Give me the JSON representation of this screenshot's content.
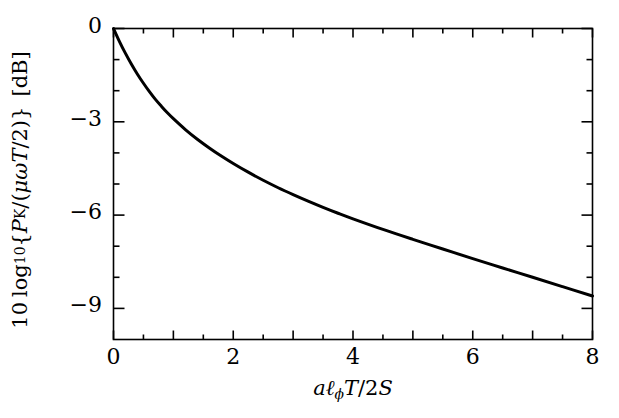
{
  "figure": {
    "background_color": "#ffffff",
    "line_color": "#000000",
    "axis_color": "#000000"
  },
  "axis_titles": {
    "y_parts": {
      "coefficient": "10",
      "log": "log",
      "log_base": "10",
      "open_brace": "{",
      "numerator_P": "P",
      "numerator_sub": "K",
      "slash": "/",
      "open_paren": "(",
      "mu": "μ",
      "omega": "ω",
      "T": "T",
      "over_two": "/2",
      "close_paren": ")",
      "close_brace": "}",
      "unit": "[dB]"
    },
    "y_plain": "10 log10{PK/(μωT/2)} [dB]",
    "x_parts": {
      "a": "a",
      "ell": "ℓ",
      "ell_sub": "ϕ",
      "T": "T",
      "slash_two": "/2",
      "S": "S"
    },
    "x_plain": "aℓϕT/2S"
  },
  "ticks": {
    "x_major_labels": [
      "0",
      "2",
      "4",
      "6",
      "8"
    ],
    "x_major_values": [
      0,
      2,
      4,
      6,
      8
    ],
    "x_minor_step": 0.5,
    "y_major_labels": [
      "0",
      "−3",
      "−6",
      "−9"
    ],
    "y_major_values": [
      0,
      -3,
      -6,
      -9
    ],
    "y_minor_step": 1
  },
  "chart_data": {
    "type": "line",
    "title": "",
    "subtitle": "",
    "xlabel": "aℓϕT/2S",
    "ylabel": "10 log10{PK/(μωT/2)} [dB]",
    "xlim": [
      0,
      8
    ],
    "ylim": [
      -10,
      0
    ],
    "grid": false,
    "legend": null,
    "series": [
      {
        "name": "PK attenuation",
        "color": "#000000",
        "linewidth": 3,
        "x": [
          0.0,
          0.1,
          0.2,
          0.3,
          0.4,
          0.5,
          0.6,
          0.7,
          0.8,
          0.9,
          1.0,
          1.2,
          1.4,
          1.6,
          1.8,
          2.0,
          2.25,
          2.5,
          2.75,
          3.0,
          3.25,
          3.5,
          3.75,
          4.0,
          4.5,
          5.0,
          5.5,
          6.0,
          6.5,
          7.0,
          7.5,
          8.0
        ],
        "y": [
          0.0,
          -0.42,
          -0.8,
          -1.15,
          -1.47,
          -1.76,
          -2.03,
          -2.28,
          -2.5,
          -2.71,
          -2.9,
          -3.25,
          -3.56,
          -3.84,
          -4.1,
          -4.34,
          -4.62,
          -4.88,
          -5.12,
          -5.34,
          -5.55,
          -5.75,
          -5.94,
          -6.12,
          -6.46,
          -6.78,
          -7.09,
          -7.4,
          -7.7,
          -8.0,
          -8.3,
          -8.6
        ]
      }
    ]
  }
}
